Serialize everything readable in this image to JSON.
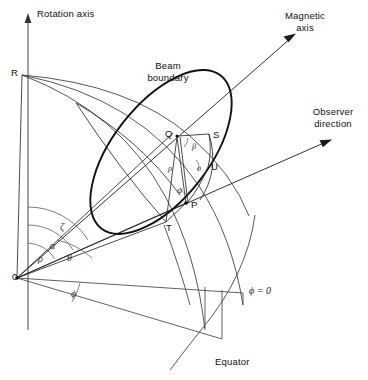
{
  "figure": {
    "background_color": "#ffffff",
    "line_color": "#1a1a1a",
    "thin_line_color": "#444444",
    "width": 368,
    "height": 380
  },
  "axes": {
    "rotation_axis_label": "Rotation axis",
    "magnetic_axis_label_line1": "Magnetic",
    "magnetic_axis_label_line2": "axis",
    "observer_label_line1": "Observer",
    "observer_label_line2": "direction"
  },
  "annotations": {
    "beam_boundary_line1": "Beam",
    "beam_boundary_line2": "boundary",
    "equator_label": "Equator",
    "phi_zero_label": "ϕ = 0"
  },
  "points": [
    {
      "name": "origin",
      "label": "0",
      "x": 17,
      "y": 278
    },
    {
      "name": "point-r",
      "label": "R",
      "x": 22,
      "y": 74
    },
    {
      "name": "point-q",
      "label": "Q",
      "x": 171,
      "y": 139
    },
    {
      "name": "point-s",
      "label": "S",
      "x": 213,
      "y": 139
    },
    {
      "name": "point-u",
      "label": "U",
      "x": 211,
      "y": 169
    },
    {
      "name": "point-p",
      "label": "P",
      "x": 188,
      "y": 206
    },
    {
      "name": "point-t",
      "label": "T",
      "x": 170,
      "y": 227
    }
  ],
  "angles": [
    {
      "name": "zeta",
      "symbol": "ζ",
      "description": "angle between rotation axis and observer direction"
    },
    {
      "name": "alpha",
      "symbol": "α",
      "description": "angle between rotation axis and magnetic axis"
    },
    {
      "name": "rho-origin",
      "symbol": "ρ",
      "description": "beam half-opening angle at origin"
    },
    {
      "name": "theta",
      "symbol": "θ",
      "description": "polar angle"
    },
    {
      "name": "phi",
      "symbol": "ϕ",
      "description": "azimuthal angle measured in equatorial plane"
    },
    {
      "name": "beta",
      "symbol": "β",
      "description": "impact angle at Q"
    },
    {
      "name": "sigma",
      "symbol": "σ",
      "description": "angle at U"
    },
    {
      "name": "rho-beam",
      "symbol": "ρ",
      "description": "beam radius QP"
    },
    {
      "name": "psi",
      "symbol": "ψ",
      "description": "position angle at P"
    }
  ]
}
